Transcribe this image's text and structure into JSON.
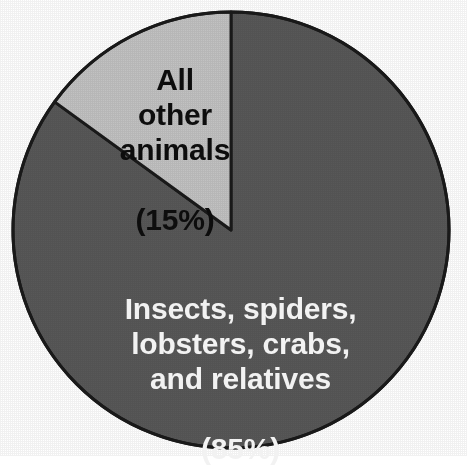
{
  "chart_data": {
    "type": "pie",
    "title": "",
    "subtitle": "",
    "xlabel": "",
    "ylabel": "",
    "legend_position": "none",
    "grid": false,
    "labels_inside_slices": true,
    "total_percent": 100,
    "slices": [
      {
        "name": "arthropods",
        "label": "Insects, spiders,\nlobsters, crabs,\nand relatives",
        "percent_text": "(85%)",
        "full_label": "Insects, spiders, lobsters, crabs, and relatives (85%)",
        "value": 85,
        "color": "#585858",
        "text_color": "#f2f2f2",
        "start_angle_deg": 0,
        "end_angle_deg": 306
      },
      {
        "name": "all-other-animals",
        "label": "All\nother\nanimals",
        "percent_text": "(15%)",
        "full_label": "All other animals (15%)",
        "value": 15,
        "color": "#c2c2c2",
        "text_color": "#0d0d0d",
        "start_angle_deg": 306,
        "end_angle_deg": 360
      }
    ],
    "geometry": {
      "center_x": 231,
      "center_y": 230,
      "radius": 218
    },
    "stroke_color": "#1a1a1a",
    "stroke_width": 3,
    "background_color": "#ffffff"
  },
  "figure": {
    "background_color": "#ffffff",
    "outline_color": "#1a1a1a"
  }
}
